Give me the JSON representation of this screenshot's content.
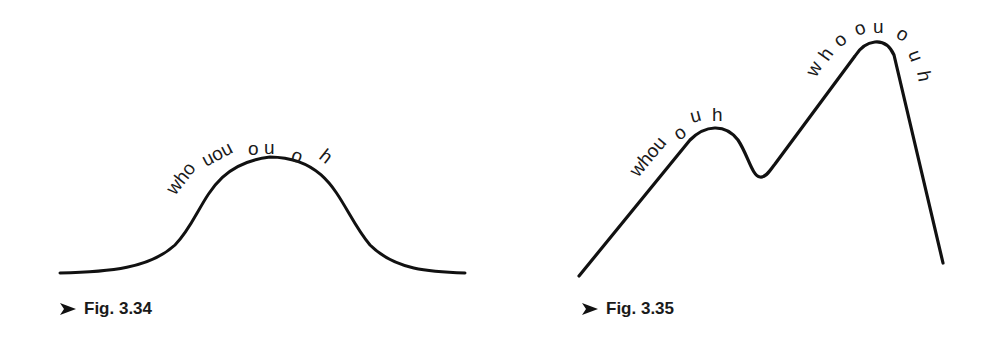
{
  "figures": [
    {
      "id": "fig-3-34",
      "caption": "Fig. 3.34",
      "caption_pos": {
        "x": 60,
        "y": 311
      },
      "description": "Single smooth bell-shaped hump",
      "curve_path": "M 60 273 C 110 272, 150 268, 175 245 C 205 215, 205 165, 270 157 C 335 158, 340 210, 370 245 C 395 270, 430 272, 465 273",
      "stroke_width": 3,
      "labels": [
        {
          "text": "who",
          "x": 175,
          "y": 196,
          "rotate": -52
        },
        {
          "text": "uou",
          "x": 206,
          "y": 167,
          "rotate": -28
        },
        {
          "text": "o",
          "x": 248,
          "y": 155,
          "rotate": 0
        },
        {
          "text": "u",
          "x": 264,
          "y": 154,
          "rotate": 0
        },
        {
          "text": "o",
          "x": 290,
          "y": 160,
          "rotate": 20
        },
        {
          "text": "h",
          "x": 318,
          "y": 158,
          "rotate": 38
        }
      ]
    },
    {
      "id": "fig-3-35",
      "caption": "Fig. 3.35",
      "caption_pos": {
        "x": 582,
        "y": 311
      },
      "description": "Two peaks: small rounded peak, dip, tall peak with steep descent",
      "curve_path": "M 579 276 L 690 140 C 705 125, 725 123, 738 140 C 748 155, 752 176, 760 177 C 766 178, 770 170, 775 164 L 855 56 C 865 40, 885 35, 894 55 L 943 263",
      "stroke_width": 3.2,
      "labels": [
        {
          "text": "whou",
          "x": 638,
          "y": 178,
          "rotate": -50
        },
        {
          "text": "o",
          "x": 679,
          "y": 141,
          "rotate": -35
        },
        {
          "text": "u",
          "x": 692,
          "y": 123,
          "rotate": -15
        },
        {
          "text": "h",
          "x": 712,
          "y": 121,
          "rotate": 0
        },
        {
          "text": "w",
          "x": 816,
          "y": 78,
          "rotate": -60
        },
        {
          "text": "h",
          "x": 828,
          "y": 62,
          "rotate": -55
        },
        {
          "text": "o",
          "x": 840,
          "y": 48,
          "rotate": -40
        },
        {
          "text": "o",
          "x": 857,
          "y": 36,
          "rotate": -20
        },
        {
          "text": "u",
          "x": 873,
          "y": 33,
          "rotate": 0
        },
        {
          "text": "o",
          "x": 895,
          "y": 37,
          "rotate": 30
        },
        {
          "text": "u",
          "x": 908,
          "y": 53,
          "rotate": 70
        },
        {
          "text": "h",
          "x": 917,
          "y": 72,
          "rotate": 80
        }
      ]
    }
  ],
  "colors": {
    "ink": "#111111",
    "background": "#ffffff"
  }
}
